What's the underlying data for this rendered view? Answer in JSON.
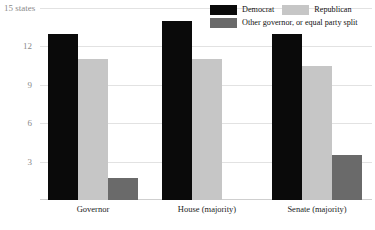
{
  "chart_data": {
    "type": "bar",
    "title": "",
    "subtitle": "",
    "xlabel": "",
    "ylabel": "states",
    "categories": [
      "Governor",
      "House (majority)",
      "Senate (majority)"
    ],
    "series": [
      {
        "name": "Democrat",
        "color": "#0a0a0a",
        "values": [
          13,
          14,
          13
        ]
      },
      {
        "name": "Republican",
        "color": "#c6c6c6",
        "values": [
          11,
          11,
          10.5
        ]
      },
      {
        "name": "Other governor, or equal party split",
        "color": "#6a6a6a",
        "values": [
          1.7,
          0,
          3.5
        ]
      }
    ],
    "ylim": [
      0,
      15
    ],
    "yticks": [
      3,
      6,
      9,
      12,
      15
    ],
    "ytick_labels": [
      "3",
      "6",
      "9",
      "12",
      "15 states"
    ],
    "grid": true,
    "legend_position": "top-right"
  },
  "axis": {
    "top_label": "15 states",
    "tick_12": "12",
    "tick_9": "9",
    "tick_6": "6",
    "tick_3": "3"
  },
  "legend": {
    "democrat": "Democrat",
    "republican": "Republican",
    "other": "Other governor, or equal party split"
  },
  "categories": {
    "governor": "Governor",
    "house": "House (majority)",
    "senate": "Senate (majority)"
  }
}
